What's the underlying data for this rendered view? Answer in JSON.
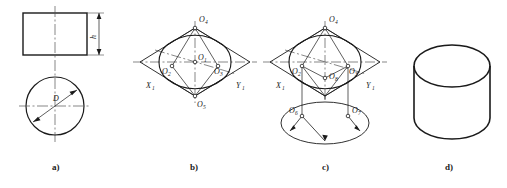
{
  "figure": {
    "panels": [
      {
        "id": "a",
        "caption": "a)",
        "description": "Two-view orthographic drawing of a cylinder: front view rectangle with height h, top view circle with diameter D",
        "labels": [
          {
            "name": "height-label",
            "text": "h"
          },
          {
            "name": "diameter-label",
            "text": "D"
          }
        ]
      },
      {
        "id": "b",
        "caption": "b)",
        "description": "Isometric rhombus with four-centre ellipse approximation of the top circle",
        "labels": [
          {
            "name": "point-o1",
            "text": "O",
            "sub": "1"
          },
          {
            "name": "point-o2",
            "text": "O",
            "sub": "2"
          },
          {
            "name": "point-o3",
            "text": "O",
            "sub": "3"
          },
          {
            "name": "point-o4",
            "text": "O",
            "sub": "4"
          },
          {
            "name": "point-o5",
            "text": "O",
            "sub": "5"
          },
          {
            "name": "axis-x1",
            "text": "X",
            "sub": "1"
          },
          {
            "name": "axis-y1",
            "text": "Y",
            "sub": "1"
          }
        ]
      },
      {
        "id": "c",
        "caption": "c)",
        "description": "Top ellipse centres translated downward by height h to build the bottom ellipse; arcs swung from O6 and O7",
        "labels": [
          {
            "name": "point-o2",
            "text": "O",
            "sub": "2"
          },
          {
            "name": "point-o3",
            "text": "O",
            "sub": "3"
          },
          {
            "name": "point-o4",
            "text": "O",
            "sub": "4"
          },
          {
            "name": "point-o6",
            "text": "O",
            "sub": "6"
          },
          {
            "name": "point-o7",
            "text": "O",
            "sub": "7"
          },
          {
            "name": "point-o8",
            "text": "O",
            "sub": "8"
          },
          {
            "name": "axis-x1",
            "text": "X",
            "sub": "1"
          },
          {
            "name": "axis-y1",
            "text": "Y",
            "sub": "1"
          }
        ]
      },
      {
        "id": "d",
        "caption": "d)",
        "description": "Finished isometric view of the cylinder with construction lines removed",
        "labels": []
      }
    ]
  },
  "colors": {
    "line": "#1a1a1a",
    "thin_line": "#4a4a4a",
    "center_line": "#555555",
    "background": "#ffffff"
  }
}
